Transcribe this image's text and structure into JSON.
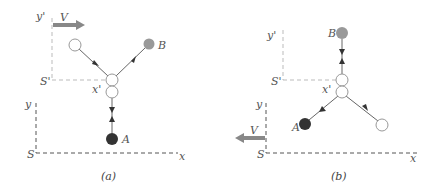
{
  "colors": {
    "axis": "#555555",
    "primed_axis": "#bbbbbb",
    "velocity_arrow": "#888888",
    "ball_A": "#333333",
    "ball_B": "#999999",
    "ball_white_stroke": "#888888",
    "track": "#666666"
  },
  "panels": [
    {
      "caption": "(a)",
      "labels": {
        "y_prime": "y'",
        "s_prime": "S'",
        "x_prime": "x'",
        "y": "y",
        "s": "S",
        "x": "x",
        "v": "V",
        "a": "A",
        "b": "B"
      }
    },
    {
      "caption": "(b)",
      "labels": {
        "y_prime": "y'",
        "s_prime": "S'",
        "x_prime": "x'",
        "y": "y",
        "s": "S",
        "x": "x",
        "v": "V",
        "a": "A",
        "b": "B"
      }
    }
  ]
}
